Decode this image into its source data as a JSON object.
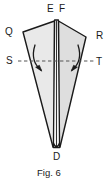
{
  "figure": {
    "caption": "Fig. 6",
    "title": "Fig. 6",
    "labels": {
      "top_left_spine": "E",
      "top_right_spine": "F",
      "upper_left_wing": "Q",
      "upper_right_wing": "R",
      "mid_left": "S",
      "mid_right": "T",
      "bottom_point": "D"
    },
    "colors": {
      "outline": "#1a1a1a",
      "fill_left": "#e8e8e8",
      "fill_right": "#dcdcdc",
      "spine_fill": "#f4f4f4",
      "dashed_line": "#6b6b6b",
      "arrow": "#1a1a1a",
      "background": "#ffffff",
      "text": "#1a1a1a"
    },
    "geometry": {
      "apex_x": 56,
      "apex_y": 21,
      "tip_x": 57,
      "tip_y": 148,
      "left_wing_tip_x": 23,
      "left_wing_tip_y": 32,
      "right_wing_tip_x": 86,
      "right_wing_tip_y": 37,
      "fold_line_y": 61,
      "fold_line_x_start": 18,
      "fold_line_x_end": 94
    },
    "annotations": {
      "fold_line_style": "dashed",
      "left_arrow": "curved-arrow-inward-left",
      "right_arrow": "curved-arrow-inward-right",
      "spine_description": "vertical double-line spine from E-F down to D"
    }
  }
}
